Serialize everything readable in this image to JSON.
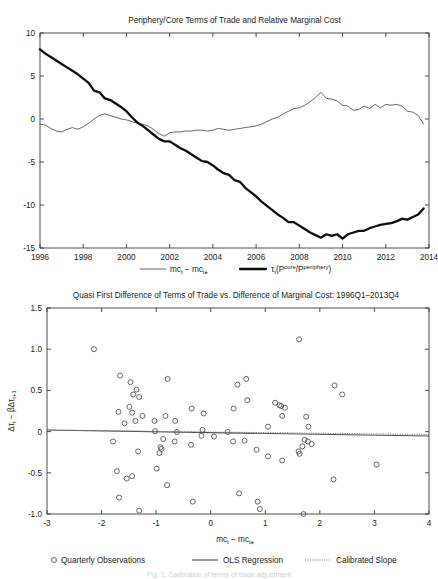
{
  "figure": {
    "caption": "Fig. 1.  Calibration of terms of trade adjustment",
    "colors": {
      "thin_series": "#4a4a4a",
      "thick_series": "#0d0d0d",
      "marker": "#4d4d4d",
      "axis": "#3a3a3a"
    }
  },
  "chart_data": [
    {
      "type": "line",
      "title": "Periphery/Core Terms of Trade and Relative Marginal Cost",
      "xlabel": "",
      "ylabel": "",
      "xlim": [
        1996,
        2014
      ],
      "ylim": [
        -15,
        10
      ],
      "xticks": [
        1996,
        1998,
        2000,
        2002,
        2004,
        2006,
        2008,
        2010,
        2012,
        2014
      ],
      "xtick_labels": [
        "1996",
        "1998",
        "2000",
        "2002",
        "2004",
        "2006",
        "2008",
        "2010",
        "2012",
        "2014"
      ],
      "yticks": [
        10,
        5,
        0,
        -5,
        -10,
        -15
      ],
      "ytick_labels": [
        "10",
        "5",
        "0",
        "-5",
        "-10",
        "-15"
      ],
      "grid": false,
      "legend_position": "below",
      "series": [
        {
          "name": "mc_t - mc_t*",
          "legend_label_html": "mc<sub>t</sub> − mc<sub>t</sub>*",
          "style": "thin",
          "x": [
            1996.0,
            1996.25,
            1996.5,
            1996.75,
            1997.0,
            1997.25,
            1997.5,
            1997.75,
            1998.0,
            1998.25,
            1998.5,
            1998.75,
            1999.0,
            1999.25,
            1999.5,
            1999.75,
            2000.0,
            2000.25,
            2000.5,
            2000.75,
            2001.0,
            2001.25,
            2001.5,
            2001.75,
            2002.0,
            2002.25,
            2002.5,
            2002.75,
            2003.0,
            2003.25,
            2003.5,
            2003.75,
            2004.0,
            2004.25,
            2004.5,
            2004.75,
            2005.0,
            2005.25,
            2005.5,
            2005.75,
            2006.0,
            2006.25,
            2006.5,
            2006.75,
            2007.0,
            2007.25,
            2007.5,
            2007.75,
            2008.0,
            2008.25,
            2008.5,
            2008.75,
            2009.0,
            2009.25,
            2009.5,
            2009.75,
            2010.0,
            2010.25,
            2010.5,
            2010.75,
            2011.0,
            2011.25,
            2011.5,
            2011.75,
            2012.0,
            2012.25,
            2012.5,
            2012.75,
            2013.0,
            2013.25,
            2013.5,
            2013.75
          ],
          "y": [
            -0.6,
            -0.7,
            -1.1,
            -1.4,
            -1.5,
            -1.2,
            -1.0,
            -1.2,
            -0.9,
            -0.5,
            0.0,
            0.4,
            0.6,
            0.4,
            0.2,
            0.0,
            -0.1,
            -0.3,
            -0.5,
            -0.6,
            -0.8,
            -1.2,
            -1.7,
            -2.0,
            -1.6,
            -1.5,
            -1.5,
            -1.4,
            -1.4,
            -1.3,
            -1.3,
            -1.4,
            -1.3,
            -1.1,
            -1.2,
            -1.3,
            -1.2,
            -1.1,
            -1.0,
            -0.9,
            -0.8,
            -0.6,
            -0.3,
            0.0,
            0.2,
            0.6,
            0.9,
            1.2,
            1.3,
            1.6,
            2.0,
            2.5,
            3.1,
            2.4,
            2.3,
            2.1,
            1.6,
            1.5,
            1.0,
            1.1,
            1.5,
            1.2,
            1.7,
            1.3,
            1.7,
            1.6,
            1.7,
            1.5,
            0.9,
            0.8,
            0.4,
            -0.6
          ]
        },
        {
          "name": "tau_t(P_core/P_periphery)",
          "legend_label_html": "τ<sub>t</sub>(P<sup>core</sup>/P<sup>periphery</sup>)",
          "style": "thick",
          "x": [
            1996.0,
            1996.25,
            1996.5,
            1996.75,
            1997.0,
            1997.25,
            1997.5,
            1997.75,
            1998.0,
            1998.25,
            1998.5,
            1998.75,
            1999.0,
            1999.25,
            1999.5,
            1999.75,
            2000.0,
            2000.25,
            2000.5,
            2000.75,
            2001.0,
            2001.25,
            2001.5,
            2001.75,
            2002.0,
            2002.25,
            2002.5,
            2002.75,
            2003.0,
            2003.25,
            2003.5,
            2003.75,
            2004.0,
            2004.25,
            2004.5,
            2004.75,
            2005.0,
            2005.25,
            2005.5,
            2005.75,
            2006.0,
            2006.25,
            2006.5,
            2006.75,
            2007.0,
            2007.25,
            2007.5,
            2007.75,
            2008.0,
            2008.25,
            2008.5,
            2008.75,
            2009.0,
            2009.25,
            2009.5,
            2009.75,
            2010.0,
            2010.25,
            2010.5,
            2010.75,
            2011.0,
            2011.25,
            2011.5,
            2011.75,
            2012.0,
            2012.25,
            2012.5,
            2012.75,
            2013.0,
            2013.25,
            2013.5,
            2013.75
          ],
          "y": [
            8.1,
            7.6,
            7.2,
            6.8,
            6.4,
            6.0,
            5.6,
            5.2,
            4.7,
            4.2,
            3.3,
            3.1,
            2.4,
            2.2,
            1.8,
            1.4,
            0.9,
            0.2,
            -0.4,
            -0.8,
            -1.3,
            -1.8,
            -2.3,
            -2.6,
            -2.6,
            -3.0,
            -3.4,
            -3.7,
            -4.1,
            -4.5,
            -4.9,
            -5.0,
            -5.4,
            -5.9,
            -6.3,
            -6.5,
            -7.1,
            -7.3,
            -8.0,
            -8.5,
            -9.0,
            -9.6,
            -10.1,
            -10.6,
            -11.1,
            -11.5,
            -12.0,
            -12.0,
            -12.4,
            -12.8,
            -13.2,
            -13.5,
            -13.8,
            -13.4,
            -13.6,
            -13.4,
            -13.9,
            -13.4,
            -13.2,
            -13.0,
            -13.0,
            -12.7,
            -12.5,
            -12.3,
            -12.2,
            -12.1,
            -11.9,
            -11.6,
            -11.7,
            -11.4,
            -11.1,
            -10.4
          ]
        }
      ]
    },
    {
      "type": "scatter",
      "title": "Quasi First Difference of Terms of Trade vs. Difference of Marginal Cost: 1996Q1–2013Q4",
      "xlabel": "mc_t - mc_t*",
      "xlabel_html": "mc<sub>t</sub> − mc<sub>t</sub>*",
      "ylabel": "Δτ_t - βΔτ_{t+1}",
      "ylabel_html": "Δτ<sub>t</sub> − βΔτ<sub>t+1</sub>",
      "xlim": [
        -3,
        4
      ],
      "ylim": [
        -1.0,
        1.5
      ],
      "xticks": [
        -3,
        -2,
        -1,
        0,
        1,
        2,
        3,
        4
      ],
      "xtick_labels": [
        "-3",
        "-2",
        "-1",
        "0",
        "1",
        "2",
        "3",
        "4"
      ],
      "yticks": [
        1.5,
        1.0,
        0.5,
        0,
        -0.5,
        -1.0
      ],
      "ytick_labels": [
        "1.5",
        "1.0",
        "0.5",
        "0",
        "-0.5",
        "-1.0"
      ],
      "grid": false,
      "legend_position": "below",
      "legend": [
        {
          "label": "Quarterly Observations",
          "marker": "circle"
        },
        {
          "label": "OLS Regression",
          "marker": "solid-line"
        },
        {
          "label": "Calibrated Slope",
          "marker": "dotted-line"
        }
      ],
      "points": [
        [
          -2.14,
          1.0
        ],
        [
          1.62,
          1.12
        ],
        [
          -1.66,
          0.68
        ],
        [
          -0.79,
          0.64
        ],
        [
          0.65,
          0.64
        ],
        [
          -1.47,
          0.6
        ],
        [
          0.49,
          0.57
        ],
        [
          2.27,
          0.56
        ],
        [
          -1.36,
          0.51
        ],
        [
          -1.42,
          0.45
        ],
        [
          2.41,
          0.45
        ],
        [
          -1.31,
          0.42
        ],
        [
          0.67,
          0.38
        ],
        [
          1.18,
          0.35
        ],
        [
          1.26,
          0.32
        ],
        [
          1.29,
          0.31
        ],
        [
          -1.49,
          0.3
        ],
        [
          1.36,
          0.29
        ],
        [
          -0.35,
          0.28
        ],
        [
          0.42,
          0.28
        ],
        [
          -1.69,
          0.24
        ],
        [
          -1.44,
          0.23
        ],
        [
          -0.13,
          0.22
        ],
        [
          1.31,
          0.19
        ],
        [
          -0.83,
          0.19
        ],
        [
          1.75,
          0.18
        ],
        [
          -1.25,
          0.19
        ],
        [
          -1.38,
          0.13
        ],
        [
          -0.65,
          0.13
        ],
        [
          -1.03,
          0.13
        ],
        [
          -1.58,
          0.1
        ],
        [
          1.05,
          0.06
        ],
        [
          1.79,
          0.06
        ],
        [
          -0.15,
          0.02
        ],
        [
          -1.02,
          0.005
        ],
        [
          -0.62,
          -0.005
        ],
        [
          0.31,
          -0.005
        ],
        [
          -0.17,
          -0.05
        ],
        [
          0.06,
          -0.06
        ],
        [
          -0.87,
          -0.09
        ],
        [
          -1.79,
          -0.12
        ],
        [
          -0.66,
          -0.12
        ],
        [
          0.41,
          -0.12
        ],
        [
          1.72,
          -0.1
        ],
        [
          0.62,
          -0.11
        ],
        [
          1.78,
          -0.12
        ],
        [
          -0.36,
          -0.16
        ],
        [
          1.68,
          -0.18
        ],
        [
          -0.92,
          -0.19
        ],
        [
          -0.9,
          -0.21
        ],
        [
          1.85,
          -0.15
        ],
        [
          0.84,
          -0.22
        ],
        [
          -1.33,
          -0.24
        ],
        [
          -0.94,
          -0.26
        ],
        [
          1.61,
          -0.24
        ],
        [
          1.63,
          -0.27
        ],
        [
          1.05,
          -0.3
        ],
        [
          1.31,
          -0.35
        ],
        [
          3.04,
          -0.4
        ],
        [
          -0.99,
          -0.45
        ],
        [
          -1.72,
          -0.48
        ],
        [
          -1.54,
          -0.57
        ],
        [
          2.25,
          -0.58
        ],
        [
          -1.44,
          -0.54
        ],
        [
          -0.8,
          -0.65
        ],
        [
          0.52,
          -0.75
        ],
        [
          -1.68,
          -0.8
        ],
        [
          -0.33,
          -0.85
        ],
        [
          0.86,
          -0.85
        ],
        [
          0.9,
          -0.94
        ],
        [
          -1.31,
          -0.96
        ],
        [
          1.7,
          -1.0
        ]
      ],
      "lines": [
        {
          "name": "OLS Regression",
          "style": "solid",
          "intercept": -0.012,
          "slope": -0.0105
        },
        {
          "name": "Calibrated Slope",
          "style": "dotted",
          "intercept": -0.005,
          "slope": -0.0075
        }
      ]
    }
  ]
}
